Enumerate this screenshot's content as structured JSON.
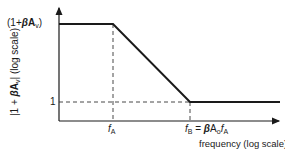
{
  "diagram": {
    "title": "",
    "y_axis_label": {
      "prefix": "|1 + ",
      "beta": "β",
      "A": "A",
      "sub": "v",
      "suffix": "| (log scale)"
    },
    "x_axis_label": "frequency (log scale)",
    "y_ticks": {
      "top": {
        "open": "(1+",
        "beta": "β",
        "A": "A",
        "sub": "v",
        "close": ")"
      },
      "bottom": "1"
    },
    "x_ticks": {
      "fA": {
        "f": "f",
        "sub": "A"
      },
      "fB": {
        "f": "f",
        "sub": "B",
        "eq": " = ",
        "beta": "β",
        "A": "A",
        "Asub": "o",
        "f2": "f",
        "f2sub": "A"
      }
    },
    "colors": {
      "line": "#1a1a1a",
      "dashed": "#333333",
      "background": "#ffffff"
    },
    "curve_points": [
      [
        59,
        24
      ],
      [
        113,
        24
      ],
      [
        190,
        102
      ],
      [
        280,
        102
      ]
    ]
  }
}
